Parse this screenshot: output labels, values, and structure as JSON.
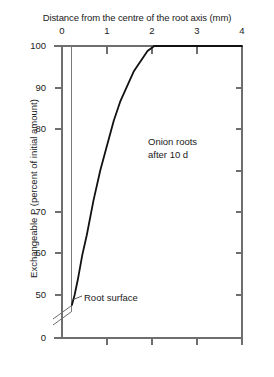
{
  "chart_data": {
    "type": "line",
    "title": "",
    "xlabel": "Distance from the centre of the root axis (mm)",
    "ylabel": "Exchangeable P (percent of initial amount)",
    "xlim": [
      0,
      4
    ],
    "ylim": [
      0,
      100
    ],
    "xticks": [
      0,
      1,
      2,
      3,
      4
    ],
    "xtick_labels": [
      "0",
      "1",
      "2",
      "3",
      "4"
    ],
    "yticks": [
      0,
      50,
      60,
      70,
      80,
      90,
      100
    ],
    "ytick_labels": [
      "0",
      "50",
      "60",
      "70",
      "80",
      "90",
      "100"
    ],
    "y_axis_break": true,
    "y_axis_break_between": [
      0,
      50
    ],
    "grid": false,
    "legend": null,
    "xaxis_position": "top",
    "annotations": [
      {
        "name": "series-label",
        "text_line_1": "Onion roots",
        "text_line_2": "after 10 d",
        "x": 2.1,
        "y": 73
      },
      {
        "name": "root-surface-label",
        "text": "Root surface",
        "x": 0.22,
        "y": 48
      }
    ],
    "reference_lines": [
      {
        "name": "root-surface-line",
        "orientation": "vertical",
        "x": 0.22,
        "color": "#7a7a7a"
      }
    ],
    "series": [
      {
        "name": "Exchangeable P depletion profile",
        "color": "#111111",
        "x": [
          0.22,
          0.28,
          0.35,
          0.45,
          0.55,
          0.7,
          0.85,
          1.0,
          1.15,
          1.3,
          1.45,
          1.6,
          1.75,
          1.9,
          2.05,
          2.2,
          2.6,
          3.0,
          3.5,
          4.0
        ],
        "values": [
          48,
          50,
          53,
          58,
          62,
          69,
          75,
          80,
          85,
          89,
          92,
          95,
          97,
          99,
          100,
          100,
          100,
          100,
          100,
          100
        ]
      }
    ]
  },
  "axis_title_x": "Distance from the centre of the root axis (mm)",
  "axis_title_y": "Exchangeable P (percent of initial amount)",
  "xtick_labels": [
    "0",
    "1",
    "2",
    "3",
    "4"
  ],
  "ytick_labels": [
    "100",
    "90",
    "80",
    "70",
    "60",
    "50",
    "0"
  ],
  "notes": {
    "onion_line_1": "Onion roots",
    "onion_line_2": "after 10 d",
    "root_surface": "Root surface"
  },
  "colors": {
    "curve": "#111111",
    "axis": "#6e6e6e",
    "text": "#1a1a1a"
  }
}
